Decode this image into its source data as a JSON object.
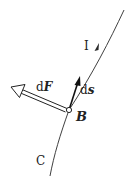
{
  "diagram": {
    "labels": {
      "current": "I",
      "ds_prefix": "d",
      "ds_var": "s",
      "dF_prefix": "d",
      "dF_var": "F",
      "field_point": "B",
      "curve": "C"
    },
    "colors": {
      "line": "#2a2a2a",
      "text": "#222222",
      "background": "#ffffff"
    },
    "geometry": {
      "curve_path": "M124,10 C110,40 92,75 69,110 C60,135 54,155 50,176",
      "point_B": [
        69,
        110
      ],
      "ds_tip": [
        80,
        77
      ],
      "dF_tip": [
        12,
        87
      ],
      "current_arrow_at": [
        97,
        48
      ]
    }
  }
}
